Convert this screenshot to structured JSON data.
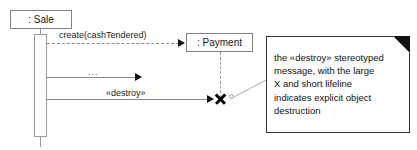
{
  "diagram": {
    "type": "sequence-diagram"
  },
  "lifelines": [
    {
      "id": "sale",
      "label": ": Sale",
      "kind": "solid"
    },
    {
      "id": "payment",
      "label": ": Payment",
      "kind": "dashed"
    }
  ],
  "messages": [
    {
      "id": "create",
      "label": "create(cashTendered)",
      "style": "dashed",
      "from": "sale",
      "to": "payment"
    },
    {
      "id": "ellipsis",
      "label": "...",
      "style": "solid",
      "from": "sale",
      "to": "open"
    },
    {
      "id": "destroy",
      "label": "«destroy»",
      "style": "solid",
      "from": "sale",
      "to": "payment"
    }
  ],
  "markers": {
    "destruction_x": "destruction-cross"
  },
  "note": {
    "text": "the «destroy» stereotyped\nmessage, with the large\nX and short lifeline\nindicates explicit object\ndestruction"
  },
  "colors": {
    "background": "#ffffff",
    "box_border": "#808080",
    "note_border": "#333333",
    "line": "#8a8a8a",
    "arrow_fill": "#111111",
    "text": "#111111"
  }
}
